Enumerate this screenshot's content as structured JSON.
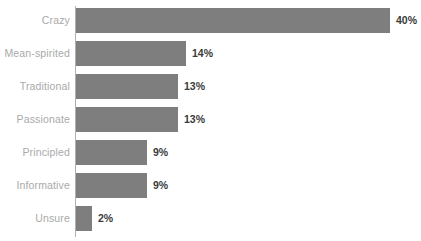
{
  "chart_data": {
    "type": "bar",
    "orientation": "horizontal",
    "title": "",
    "subtitle": "",
    "xlabel": "",
    "ylabel": "",
    "categories": [
      "Crazy",
      "Mean-spirited",
      "Traditional",
      "Passionate",
      "Principled",
      "Informative",
      "Unsure"
    ],
    "values": [
      40,
      14,
      13,
      13,
      9,
      9,
      2
    ],
    "value_labels": [
      "40%",
      "14%",
      "13%",
      "13%",
      "9%",
      "9%",
      "2%"
    ],
    "xlim": [
      0,
      44
    ],
    "grid": false,
    "legend": null,
    "bar_color": "#7e7e7e",
    "category_label_color": "#a9a9a9",
    "value_label_color": "#3b3b3b",
    "axis_color": "#b0b0b0",
    "background": "#ffffff"
  }
}
